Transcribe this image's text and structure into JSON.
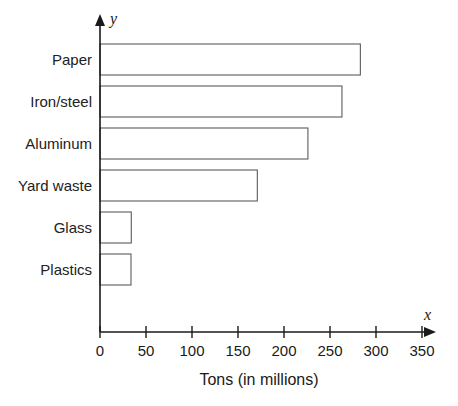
{
  "chart_data": {
    "type": "bar",
    "orientation": "horizontal",
    "title": "",
    "xlabel": "Tons (in millions)",
    "ylabel": "",
    "x_axis_letter": "x",
    "y_axis_letter": "y",
    "categories": [
      "Paper",
      "Iron/steel",
      "Aluminum",
      "Yard waste",
      "Glass",
      "Plastics"
    ],
    "values": [
      323,
      283,
      263,
      226,
      171,
      34
    ],
    "xlim": [
      0,
      350
    ],
    "xticks": [
      0,
      50,
      100,
      150,
      200,
      250,
      300,
      350
    ],
    "xticklabels": [
      "0",
      "50",
      "100",
      "150",
      "200",
      "250",
      "300",
      "350"
    ],
    "grid": false,
    "legend": false,
    "bar_fill_color": "#ffffff",
    "bar_stroke_color": "#5b5b5b",
    "axis_color": "#1a1a1a"
  },
  "labels": {
    "cat0": "Paper",
    "cat1": "Iron/steel",
    "cat2": "Aluminum",
    "cat3": "Yard waste",
    "cat4": "Glass",
    "cat5": "Plastics",
    "tick0": "0",
    "tick1": "50",
    "tick2": "100",
    "tick3": "150",
    "tick4": "200",
    "tick5": "250",
    "tick6": "300",
    "tick7": "350",
    "x_letter": "x",
    "y_letter": "y",
    "x_title": "Tons (in millions)"
  }
}
